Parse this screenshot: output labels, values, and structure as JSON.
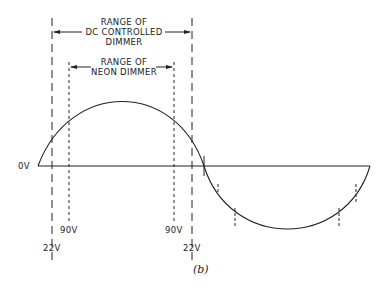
{
  "figure": {
    "caption": "(b)",
    "dc_range": {
      "line1": "RANGE OF",
      "line2": "DC CONTROLLED",
      "line3": "DIMMER"
    },
    "neon_range": {
      "line1": "RANGE OF",
      "line2": "NEON DIMMER"
    },
    "axis_label": "0V",
    "markers": {
      "left_dotted": "90V",
      "right_dotted": "90V",
      "left_dashed": "22V",
      "right_dashed": "22V"
    },
    "colors": {
      "stroke": "#222222",
      "background": "#ffffff"
    }
  }
}
